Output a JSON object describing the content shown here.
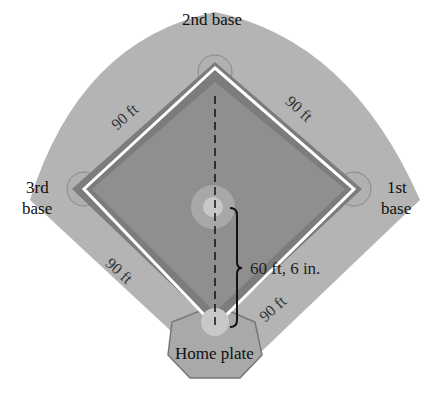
{
  "diagram": {
    "labels": {
      "second_base": "2nd base",
      "third_base_line1": "3rd",
      "third_base_line2": "base",
      "first_base_line1": "1st",
      "first_base_line2": "base",
      "home_plate": "Home plate",
      "pitch_distance": "60 ft, 6 in.",
      "side_top_left": "90 ft",
      "side_top_right": "90 ft",
      "side_bottom_left": "90 ft",
      "side_bottom_right": "90 ft"
    },
    "colors": {
      "outfield": "#b4b4b4",
      "infield": "#8e8e8e",
      "basepath": "#7a7a7a",
      "baseline": "#ffffff",
      "text": "#111111"
    }
  }
}
